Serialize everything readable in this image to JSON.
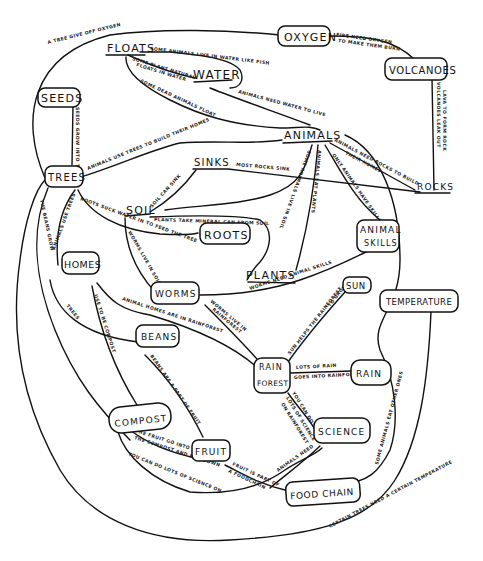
{
  "diagram": {
    "type": "hand-drawn concept map",
    "nodes": [
      {
        "id": "oxygen",
        "label": "OXYGEN",
        "boxed": true
      },
      {
        "id": "volcanoes",
        "label": "VOLCANOES",
        "boxed": true
      },
      {
        "id": "floats",
        "label": "FLOATS",
        "boxed": false
      },
      {
        "id": "water",
        "label": "WATER",
        "boxed": false
      },
      {
        "id": "seeds",
        "label": "SEEDS",
        "boxed": true
      },
      {
        "id": "trees",
        "label": "TREES",
        "boxed": true
      },
      {
        "id": "animals",
        "label": "ANIMALS",
        "boxed": false
      },
      {
        "id": "sinks",
        "label": "SINKS",
        "boxed": false
      },
      {
        "id": "rocks",
        "label": "ROCKS",
        "boxed": false
      },
      {
        "id": "soil",
        "label": "SOIL",
        "boxed": false
      },
      {
        "id": "roots",
        "label": "ROOTS",
        "boxed": true
      },
      {
        "id": "animal_skills_1",
        "label": "ANIMAL",
        "boxed": true
      },
      {
        "id": "animal_skills_2",
        "label": "SKILLS",
        "boxed": true
      },
      {
        "id": "homes",
        "label": "HOMES",
        "boxed": true
      },
      {
        "id": "plants",
        "label": "PLANTS",
        "boxed": false
      },
      {
        "id": "worms",
        "label": "WORMS",
        "boxed": true
      },
      {
        "id": "sun",
        "label": "SUN",
        "boxed": true
      },
      {
        "id": "temperature",
        "label": "TEMPERATURE",
        "boxed": true
      },
      {
        "id": "beans",
        "label": "BEANS",
        "boxed": true
      },
      {
        "id": "rain_forest_1",
        "label": "RAIN",
        "boxed": true
      },
      {
        "id": "rain_forest_2",
        "label": "FOREST",
        "boxed": true
      },
      {
        "id": "rain",
        "label": "RAIN",
        "boxed": true
      },
      {
        "id": "compost",
        "label": "COMPOST",
        "boxed": true
      },
      {
        "id": "fruit",
        "label": "FRUIT",
        "boxed": true
      },
      {
        "id": "science",
        "label": "SCIENCE",
        "boxed": true
      },
      {
        "id": "food_chain",
        "label": "FOOD CHAIN",
        "boxed": true
      }
    ],
    "edges": [
      {
        "from": "trees",
        "to": "oxygen",
        "label": "A TREE GIVE OFF OXYGEN"
      },
      {
        "from": "oxygen",
        "to": "volcanoes",
        "label_1": "FIRE NEED OXYGEN",
        "label_2": "TO MAKE THEM BURN"
      },
      {
        "from": "floats",
        "to": "water",
        "label": "SOME ANIMALS LIVE IN WATER LIKE FISH"
      },
      {
        "from": "floats",
        "to": "water",
        "label_1": "SOME PLANT NATURAL",
        "label_2": "FLOATS IN WATER"
      },
      {
        "from": "floats",
        "to": "animals",
        "label": "SOME DEAD ANIMALS FLOAT"
      },
      {
        "from": "water",
        "to": "animals",
        "label": "ANIMALS NEED WATER TO LIVE"
      },
      {
        "from": "seeds",
        "to": "trees",
        "label": "SEEDS GROW INTO TREES"
      },
      {
        "from": "volcanoes",
        "to": "rocks",
        "label_1": "VOLCANOES LEAK OUT",
        "label_2": "LAVA TO FORM ROCK"
      },
      {
        "from": "trees",
        "to": "animals",
        "label": "ANIMALS USE TREES TO BUILD THEIR HOMES"
      },
      {
        "from": "sinks",
        "to": "rocks",
        "label": "MOST ROCKS SINK"
      },
      {
        "from": "animals",
        "to": "rocks",
        "label_1": "ANIMALS NEED ROCKS TO BUILD",
        "label_2": "THEIR HOMES"
      },
      {
        "from": "animals",
        "to": "animal_skills_1",
        "label": "ONLY ANIMALS HAVE SKILLS"
      },
      {
        "from": "animals",
        "to": "plants",
        "label": "ANIMALS EAT PLANTS"
      },
      {
        "from": "animals",
        "to": "soil",
        "label": "SOME ANIMALS LIVE IN SOIL"
      },
      {
        "from": "soil",
        "to": "sinks",
        "label": "SOIL CAN SINK"
      },
      {
        "from": "soil",
        "to": "plants",
        "label": "PLANTS TAKE MINERAL CAN FROM SOIL"
      },
      {
        "from": "trees",
        "to": "roots",
        "label": "ROOTS SUCK WATER IN TO FEED THE TREE"
      },
      {
        "from": "soil",
        "to": "worms",
        "label": "WORMS LIVE IN SOIL"
      },
      {
        "from": "trees",
        "to": "homes",
        "label": "ANIMALS USE TREES"
      },
      {
        "from": "trees",
        "to": "fruit",
        "label": "THE BEANS GROW"
      },
      {
        "from": "homes",
        "to": "rain_forest_1",
        "label": "ANIMAL HOMES ARE IN RAINFOREST"
      },
      {
        "from": "homes",
        "to": "beans",
        "label": "TREES"
      },
      {
        "from": "homes",
        "to": "compost",
        "label": "USE TO BE COMPOST"
      },
      {
        "from": "worms",
        "to": "plants",
        "label": "WORMS NEED ANIMAL SKILLS"
      },
      {
        "from": "worms",
        "to": "rain_forest_1",
        "label_1": "WORMS LIVE IN",
        "label_2": "RAINFOREST"
      },
      {
        "from": "sun",
        "to": "rain_forest_1",
        "label_1": "SUN HELPS THE RAINFOREST",
        "label_2": "TO GROW"
      },
      {
        "from": "rain_forest_1",
        "to": "rain",
        "label_1": "LOTS OF RAIN",
        "label_2": "GOES INTO RAINFOREST"
      },
      {
        "from": "rain_forest_2",
        "to": "science",
        "label_1": "YOU CAN DO",
        "label_2": "LOTS OF SCIENCE",
        "label_3": "ON RAINFOREST"
      },
      {
        "from": "beans",
        "to": "fruit",
        "label": "BEANS ARE A PART OF FRUIT"
      },
      {
        "from": "compost",
        "to": "fruit",
        "label_1": "THE FRUIT GO INTO",
        "label_2": "THE COMPOST AND ROT DOWN"
      },
      {
        "from": "compost",
        "to": "science",
        "label": "YOU CAN DO LOTS OF SCIENCE ON"
      },
      {
        "from": "fruit",
        "to": "food_chain",
        "label_1": "FRUIT IS PART OF",
        "label_2": "A FOODCHAIN"
      },
      {
        "from": "science",
        "to": "food_chain",
        "label": "ANIMALS NEED"
      },
      {
        "from": "animals",
        "to": "food_chain",
        "label": "SOME ANIMALS EAT OTHER ONES"
      },
      {
        "from": "temperature",
        "to": "trees",
        "label_1": "CERTAIN TREES NEED A CERTAIN TEMPERATURE"
      }
    ]
  }
}
